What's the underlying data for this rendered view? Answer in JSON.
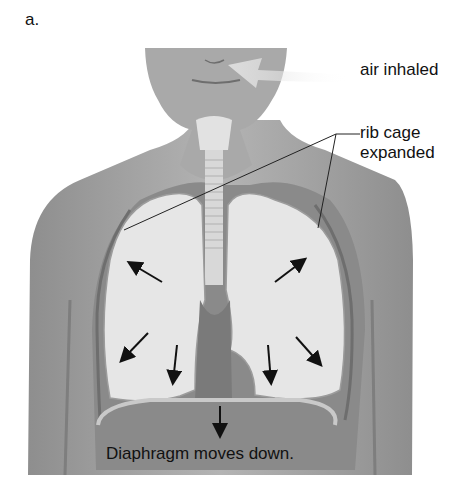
{
  "figure": {
    "panel_label": "a.",
    "labels": {
      "air_inhaled": "air inhaled",
      "rib_cage_line1": "rib cage",
      "rib_cage_line2": "expanded",
      "diaphragm": "Diaphragm moves down."
    },
    "icons": [
      "air-flow-arrow",
      "expansion-arrow",
      "diaphragm-down-arrow"
    ],
    "colors": {
      "skin": "#9a9a9a",
      "skin_light": "#b9b9b9",
      "lung": "#e6e6e6",
      "cavity": "#7c7c7c",
      "text": "#111111",
      "arrow": "#111111"
    }
  }
}
